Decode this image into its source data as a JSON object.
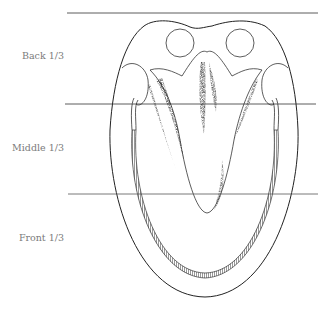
{
  "diagram": {
    "labels": [
      {
        "text": "Back 1/3",
        "y": 57
      },
      {
        "text": "Middle 1/3",
        "y": 148
      },
      {
        "text": "Front 1/3",
        "y": 238
      }
    ],
    "divider_lines_y": [
      13,
      104,
      194
    ],
    "colors": {
      "line": "#333333",
      "label": "#7a7a7a",
      "shading": "#111111"
    }
  }
}
